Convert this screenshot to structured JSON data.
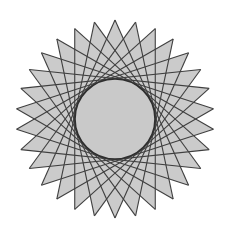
{
  "figure": {
    "type": "star-polygon",
    "points": 30,
    "skip": 11,
    "center": [
      115,
      119
    ],
    "outer_radius": 99,
    "inner_circle_radius": 40,
    "rotation_deg": -90,
    "colors": {
      "background": "#ffffff",
      "fill": "#cbcbcb",
      "stroke": "#3f3f3f",
      "circle_fill": "#c9c9c9",
      "circle_stroke": "#2e2e2e"
    }
  }
}
